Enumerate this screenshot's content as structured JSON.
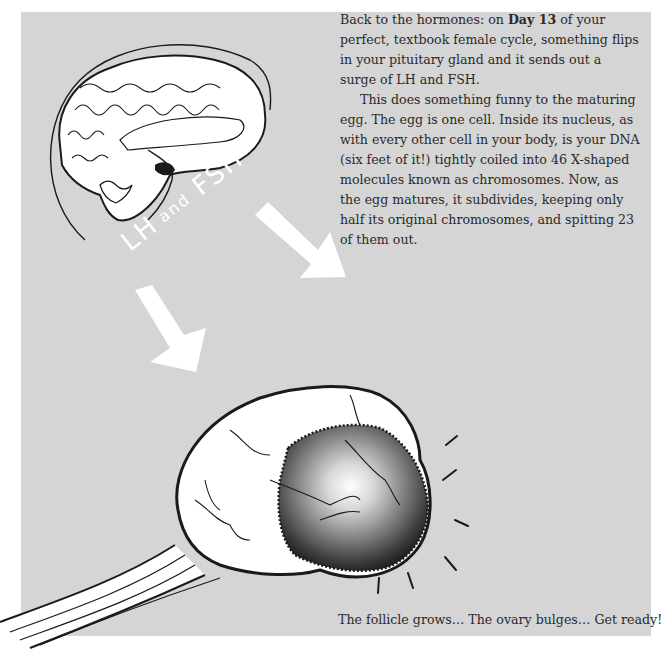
{
  "page": {
    "background_color": "#ffffff",
    "panel_color": "#d5d5d5",
    "text_color": "#2a2a2a"
  },
  "body_text": {
    "paragraph1": {
      "before_bold": "Back to the hormones: on ",
      "bold": "Day 13",
      "after_bold": " of your perfect, textbook female cycle, something flips in your pituitary gland and it sends out a surge of LH and FSH."
    },
    "paragraph2": "This does something funny to the maturing egg. The egg is one cell. Inside its nucleus, as with every other cell in your body, is your DNA (six feet of it!) tightly coiled into 46 X-shaped molecules known as chromosomes. Now, as the egg matures, it subdivides, keeping only half its original chromosomes, and spitting 23 of them out."
  },
  "illustration": {
    "brain_label": "brain-with-head-outline",
    "hormone_label": {
      "part1": "LH",
      "part2": "and",
      "part3": "FSH",
      "color": "#ffffff"
    },
    "arrows": [
      {
        "name": "arrow-down-left",
        "color": "#ffffff"
      },
      {
        "name": "arrow-down-right",
        "color": "#ffffff"
      }
    ],
    "ovary_label": "ovary-with-bulging-follicle",
    "follicle_shading": [
      "#ffffff",
      "#8a8a8a",
      "#1a1a1a"
    ]
  },
  "caption": {
    "text": "The follicle grows… The ovary bulges… Get ready!"
  }
}
